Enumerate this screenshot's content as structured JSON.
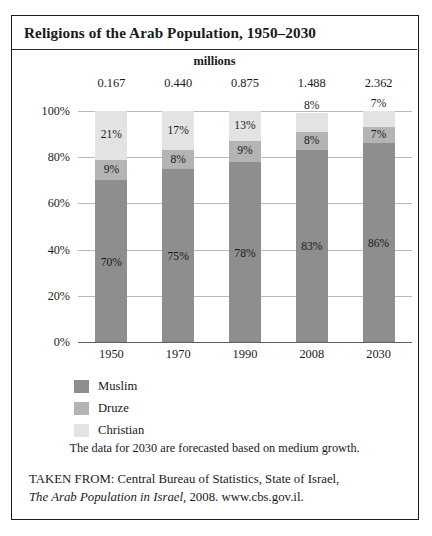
{
  "title": "Religions of the Arab Population, 1950–2030",
  "note": "The data for 2030 are forecasted based on medium growth.",
  "source": {
    "lead": "TAKEN FROM: Central Bureau of Statistics, State of Israel,",
    "italic_title": "The Arab Population in Israel",
    "tail": ", 2008. www.cbs.gov.il."
  },
  "legend": {
    "items": [
      {
        "label": "Muslim",
        "color": "#8e8e8e"
      },
      {
        "label": "Druze",
        "color": "#b4b4b4"
      },
      {
        "label": "Christian",
        "color": "#e3e3e3"
      }
    ]
  },
  "chart_data": {
    "type": "bar",
    "subtype": "stacked-percent",
    "title": "Religions of the Arab Population, 1950–2030",
    "top_header": "millions",
    "categories": [
      "1950",
      "1970",
      "1990",
      "2008",
      "2030"
    ],
    "totals_label": "millions",
    "totals": [
      "0.167",
      "0.440",
      "0.875",
      "1.488",
      "2.362"
    ],
    "totals_numeric": [
      0.167,
      0.44,
      0.875,
      1.488,
      2.362
    ],
    "series": [
      {
        "name": "Muslim",
        "color": "#8e8e8e",
        "values": [
          70,
          75,
          78,
          83,
          86
        ],
        "labels": [
          "70%",
          "75%",
          "78%",
          "83%",
          "86%"
        ]
      },
      {
        "name": "Druze",
        "color": "#b4b4b4",
        "values": [
          9,
          8,
          9,
          8,
          7
        ],
        "labels": [
          "9%",
          "8%",
          "9%",
          "8%",
          "7%"
        ]
      },
      {
        "name": "Christian",
        "color": "#e3e3e3",
        "values": [
          21,
          17,
          13,
          8,
          7
        ],
        "labels": [
          "21%",
          "17%",
          "13%",
          "8%",
          "7%"
        ]
      }
    ],
    "xlabel": "",
    "ylabel": "",
    "ylim": [
      0,
      100
    ],
    "yticks": [
      0,
      20,
      40,
      60,
      80,
      100
    ],
    "ytick_labels": [
      "0%",
      "20%",
      "40%",
      "60%",
      "80%",
      "100%"
    ],
    "grid": true,
    "legend_position": "below-left",
    "annotation": "The data for 2030 are forecasted based on medium growth."
  }
}
